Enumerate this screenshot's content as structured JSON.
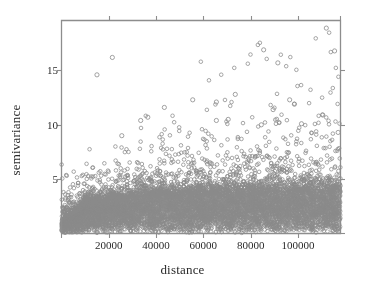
{
  "chart_data": {
    "type": "scatter",
    "title": "",
    "xlabel": "distance",
    "ylabel": "semivariance",
    "xlim": [
      0,
      118000
    ],
    "ylim": [
      0,
      19.6
    ],
    "grid": false,
    "legend": null,
    "xticks": [
      {
        "value": 20000,
        "label": "20000"
      },
      {
        "value": 40000,
        "label": "40000"
      },
      {
        "value": 60000,
        "label": "60000"
      },
      {
        "value": 80000,
        "label": "80000"
      },
      {
        "value": 100000,
        "label": "100000"
      }
    ],
    "yticks": [
      {
        "value": 5,
        "label": "5"
      },
      {
        "value": 10,
        "label": "10"
      },
      {
        "value": 15,
        "label": "15"
      }
    ],
    "marker": {
      "shape": "open-circle",
      "size_px": 3.6,
      "stroke": "#8a8a8a",
      "stroke_width": 0.8,
      "fill": "none"
    },
    "frame_color": "#8d8d8d",
    "point_count_approx": 9000,
    "notable_points": [
      {
        "x": 112000,
        "y": 18.9
      },
      {
        "x": 85500,
        "y": 16.9
      },
      {
        "x": 115500,
        "y": 16.8
      },
      {
        "x": 91500,
        "y": 15.7
      },
      {
        "x": 15000,
        "y": 14.6
      },
      {
        "x": 21500,
        "y": 16.2
      },
      {
        "x": 73500,
        "y": 12.8
      },
      {
        "x": 55500,
        "y": 12.3
      },
      {
        "x": 65500,
        "y": 12.1
      },
      {
        "x": 96500,
        "y": 12.3
      },
      {
        "x": 98500,
        "y": 11.9
      },
      {
        "x": 43500,
        "y": 11.6
      },
      {
        "x": 89500,
        "y": 11.4
      },
      {
        "x": 110500,
        "y": 10.9
      },
      {
        "x": 36500,
        "y": 10.7
      },
      {
        "x": 33500,
        "y": 10.4
      },
      {
        "x": 65500,
        "y": 10.4
      },
      {
        "x": 70500,
        "y": 10.5
      },
      {
        "x": 84500,
        "y": 10.0
      },
      {
        "x": 101500,
        "y": 10.1
      },
      {
        "x": 25500,
        "y": 9.0
      },
      {
        "x": 117000,
        "y": 9.3
      }
    ],
    "band_top_values": [
      {
        "x": 0,
        "y": 1.2
      },
      {
        "x": 10000,
        "y": 2.6
      },
      {
        "x": 20000,
        "y": 3.0
      },
      {
        "x": 35000,
        "y": 3.3
      },
      {
        "x": 50000,
        "y": 3.4
      },
      {
        "x": 70000,
        "y": 3.5
      },
      {
        "x": 90000,
        "y": 3.6
      },
      {
        "x": 118000,
        "y": 3.7
      }
    ]
  }
}
